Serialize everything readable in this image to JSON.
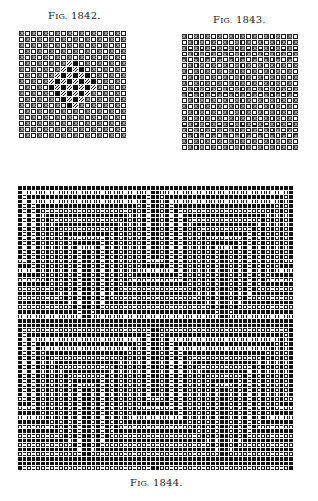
{
  "page": {
    "background": "#ffffff"
  },
  "figures": [
    {
      "id": "fig-1842",
      "caption_prefix": "F",
      "caption_sc": "IG.",
      "caption_num": " 1842.",
      "caption_pos": {
        "left": 48,
        "top": 10
      },
      "grid": {
        "left": 19,
        "top": 31,
        "cols": 18,
        "rows": 18,
        "cell": 5,
        "pattern": "twill-x-with-center-diamond"
      }
    },
    {
      "id": "fig-1843",
      "caption_prefix": "F",
      "caption_sc": "IG.",
      "caption_num": " 1843.",
      "caption_pos": {
        "left": 213,
        "top": 14
      },
      "grid": {
        "left": 182,
        "top": 34,
        "cols": 20,
        "rows": 20,
        "cell": 4.85,
        "pattern": "twill-x-shaded"
      }
    },
    {
      "id": "fig-1844",
      "caption_prefix": "F",
      "caption_sc": "IG.",
      "caption_num": " 1844.",
      "caption_pos": {
        "left": 130,
        "top": 477
      },
      "grid": {
        "left": 18,
        "top": 186,
        "cols": 60,
        "rows": 62,
        "cell": 3.6,
        "pattern": "concentric-maze"
      }
    }
  ],
  "colors": {
    "ink": "#111111",
    "paper": "#fafafa",
    "grid_line": "#f4f4f4",
    "cross": "#bdbdbd"
  }
}
